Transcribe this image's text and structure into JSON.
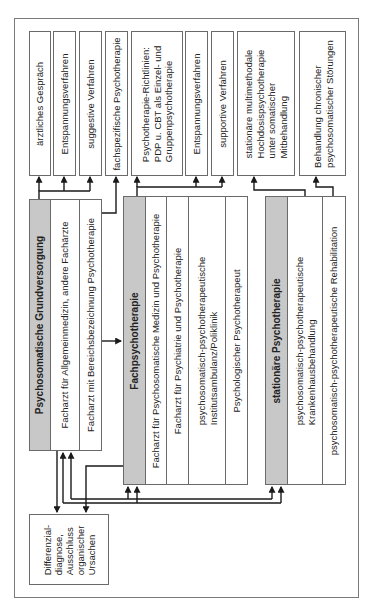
{
  "diagram": {
    "treatments": [
      {
        "id": "t1",
        "lines": [
          "ärztliches Gespräch"
        ]
      },
      {
        "id": "t2",
        "lines": [
          "Entspannungsverfahren"
        ]
      },
      {
        "id": "t3",
        "lines": [
          "suggestive Verfahren"
        ]
      },
      {
        "id": "t4",
        "lines": [
          "fachspezifische Psychotherapie"
        ]
      },
      {
        "id": "t5",
        "lines": [
          "Psychotherapie-Richtlinien:",
          "PDP u. CBT als Einzel- und",
          "Gruppenpsychotherapie"
        ]
      },
      {
        "id": "t6",
        "lines": [
          "Entspannungsverfahren"
        ]
      },
      {
        "id": "t7",
        "lines": [
          "supportive Verfahren"
        ]
      },
      {
        "id": "t8",
        "lines": [
          "stationäre multimethodale",
          "Hochdosispsychotherapie",
          "unter somatischer",
          "Mitbehandlung"
        ]
      },
      {
        "id": "t9",
        "lines": [
          "Behandlung chronischer",
          "psychosomatischer Störungen"
        ]
      }
    ],
    "groups": {
      "grundversorgung": {
        "title": "Psychosomatische Grundversorgung",
        "members": [
          {
            "lines": [
              "Facharzt für Allgemeinmedizin, andere Fachärzte"
            ]
          },
          {
            "lines": [
              "Facharzt mit Bereichsbezeichnung Psychotherapie"
            ]
          }
        ]
      },
      "fachpsychotherapie": {
        "title": "Fachpsychotherapie",
        "members": [
          {
            "lines": [
              "Facharzt für Psychosomatische Medizin und Psychotherapie"
            ]
          },
          {
            "lines": [
              "Facharzt für Psychiatrie und Psychotherapie"
            ]
          },
          {
            "lines": [
              "psychosomatisch-psychotherapeutische",
              "Institutsambulanz/Poliklinik"
            ]
          },
          {
            "lines": [
              "Psychologischer Psychotherapeut"
            ]
          }
        ]
      },
      "stationaer": {
        "title": "stationäre Psychotherapie",
        "members": [
          {
            "lines": [
              "psychosomatisch-psychotherapeutische",
              "Krankenhausbehandlung"
            ]
          },
          {
            "lines": [
              "psychosomatisch-psychotherapeutische Rehabilitation"
            ]
          }
        ]
      }
    },
    "diagnosis": {
      "lines": [
        "Differenzial-",
        "diagnose,",
        "Ausschluss",
        "organischer",
        "Ursachen"
      ]
    },
    "colors": {
      "header_gray": "#c8c8c8",
      "border": "#6a6a6a",
      "arrow": "#1a1a1a"
    }
  }
}
